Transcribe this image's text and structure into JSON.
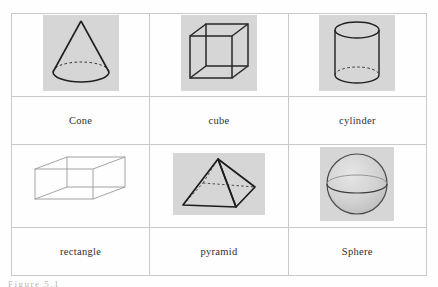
{
  "figure": {
    "caption": "Figure   5.1",
    "caption_visible_partially": true
  },
  "table": {
    "columns": 3,
    "rows": 2,
    "border_color": "#c9c9c9",
    "tile_background": "#d6d6d6",
    "ink_color": "#1f1f1f",
    "cells": [
      {
        "label": "Cone",
        "shape": "cone-icon",
        "has_gray_tile": true,
        "hidden_edges": "dashed-back-arc-of-base-ellipse"
      },
      {
        "label": "cube",
        "shape": "cube-icon",
        "has_gray_tile": true,
        "hidden_edges": "all-edges-solid-wireframe"
      },
      {
        "label": "cylinder",
        "shape": "cylinder-icon",
        "has_gray_tile": true,
        "hidden_edges": "dashed-back-arc-of-bottom-ellipse"
      },
      {
        "label": "rectangle",
        "shape": "rectangular-prism-icon",
        "has_gray_tile": false,
        "hidden_edges": "all-edges-thin-light-wireframe"
      },
      {
        "label": "pyramid",
        "shape": "square-pyramid-icon",
        "has_gray_tile": true,
        "hidden_edges": "dashed-edges-to-rear-base-vertex"
      },
      {
        "label": "Sphere",
        "shape": "sphere-icon",
        "has_gray_tile": true,
        "hidden_edges": "equator-ellipse-back-arc-lighter"
      }
    ]
  }
}
